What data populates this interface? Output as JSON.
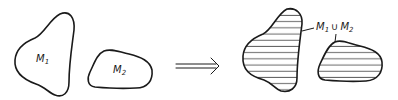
{
  "diagram": {
    "left": {
      "set1": {
        "name": "M",
        "subscript": "1"
      },
      "set2": {
        "name": "M",
        "subscript": "2"
      }
    },
    "arrow": {
      "symbol": "implies-double-arrow"
    },
    "right": {
      "union_label": {
        "left_name": "M",
        "left_subscript": "1",
        "operator": "∪",
        "right_name": "M",
        "right_subscript": "2"
      },
      "fill_pattern": "horizontal-hatching"
    },
    "colors": {
      "ink": "#1a1a1a",
      "background": "#ffffff"
    }
  }
}
